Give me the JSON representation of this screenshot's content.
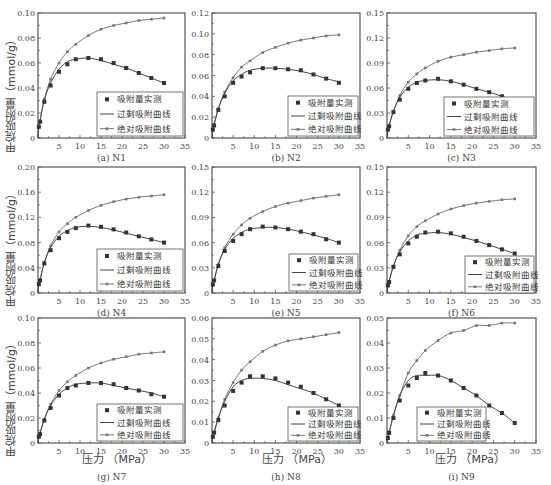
{
  "figure": {
    "ylabel": "甲烷吸附量（mmol/g）",
    "xlabel": "压力 （MPa）",
    "legend": [
      "吸附量实测",
      "过剩吸附曲线",
      "绝对吸附曲线"
    ],
    "colors": {
      "axis": "#555555",
      "excess": "#444444",
      "absolute": "#777777",
      "marker": "#333333"
    }
  },
  "chart_data": [
    {
      "id": "N1",
      "caption": "(a) N1",
      "type": "line",
      "xlim": [
        0,
        35
      ],
      "ylim": [
        0,
        0.1
      ],
      "yticks": [
        0,
        0.02,
        0.04,
        0.06,
        0.08,
        0.1
      ],
      "ytick_labels": [
        "0",
        "0.02",
        "0.04",
        "0.06",
        "0.08",
        "0.10"
      ],
      "xticks": [
        0,
        5,
        10,
        15,
        20,
        25,
        30,
        35
      ],
      "x": [
        0.2,
        0.5,
        1.5,
        3,
        5,
        7,
        9,
        12,
        15,
        18,
        21,
        24,
        27,
        30
      ],
      "series": [
        {
          "name": "吸附量实测",
          "values": [
            0.009,
            0.013,
            0.029,
            0.042,
            0.053,
            0.059,
            0.063,
            0.064,
            0.063,
            0.06,
            0.056,
            0.052,
            0.048,
            0.044
          ]
        },
        {
          "name": "过剩吸附曲线",
          "values": [
            0.009,
            0.014,
            0.03,
            0.044,
            0.055,
            0.061,
            0.063,
            0.064,
            0.062,
            0.059,
            0.056,
            0.052,
            0.048,
            0.044
          ]
        },
        {
          "name": "绝对吸附曲线",
          "values": [
            0.009,
            0.014,
            0.031,
            0.047,
            0.06,
            0.069,
            0.075,
            0.082,
            0.087,
            0.09,
            0.092,
            0.094,
            0.095,
            0.096
          ]
        }
      ],
      "legend_position": "lower right"
    },
    {
      "id": "N2",
      "caption": "(b) N2",
      "type": "line",
      "xlim": [
        0,
        35
      ],
      "ylim": [
        0,
        0.12
      ],
      "yticks": [
        0,
        0.02,
        0.04,
        0.06,
        0.08,
        0.1,
        0.12
      ],
      "ytick_labels": [
        "0",
        "0.02",
        "0.04",
        "0.06",
        "0.08",
        "0.10",
        "0.12"
      ],
      "xticks": [
        0,
        5,
        10,
        15,
        20,
        25,
        30,
        35
      ],
      "x": [
        0.2,
        0.5,
        1.5,
        3,
        5,
        7,
        9,
        12,
        15,
        18,
        21,
        24,
        27,
        30
      ],
      "series": [
        {
          "name": "吸附量实测",
          "values": [
            0.008,
            0.012,
            0.027,
            0.04,
            0.053,
            0.059,
            0.063,
            0.067,
            0.067,
            0.066,
            0.065,
            0.061,
            0.057,
            0.053
          ]
        },
        {
          "name": "过剩吸附曲线",
          "values": [
            0.008,
            0.013,
            0.028,
            0.043,
            0.055,
            0.061,
            0.065,
            0.067,
            0.067,
            0.066,
            0.064,
            0.061,
            0.057,
            0.054
          ]
        },
        {
          "name": "绝对吸附曲线",
          "values": [
            0.008,
            0.013,
            0.028,
            0.044,
            0.058,
            0.068,
            0.074,
            0.082,
            0.087,
            0.091,
            0.094,
            0.096,
            0.098,
            0.099
          ]
        }
      ],
      "legend_position": "lower right"
    },
    {
      "id": "N3",
      "caption": "(c) N3",
      "type": "line",
      "xlim": [
        0,
        35
      ],
      "ylim": [
        0,
        0.15
      ],
      "yticks": [
        0,
        0.03,
        0.06,
        0.09,
        0.12,
        0.15
      ],
      "ytick_labels": [
        "0",
        "0.03",
        "0.06",
        "0.09",
        "0.12",
        "0.15"
      ],
      "xticks": [
        0,
        5,
        10,
        15,
        20,
        25,
        30,
        35
      ],
      "x": [
        0.2,
        0.5,
        1.5,
        3,
        5,
        7,
        9,
        12,
        15,
        18,
        21,
        24,
        27,
        30
      ],
      "series": [
        {
          "name": "吸附量实测",
          "values": [
            0.01,
            0.014,
            0.031,
            0.046,
            0.059,
            0.066,
            0.069,
            0.071,
            0.068,
            0.064,
            0.059,
            0.055,
            0.05,
            0.045
          ]
        },
        {
          "name": "过剩吸附曲线",
          "values": [
            0.01,
            0.015,
            0.032,
            0.049,
            0.061,
            0.067,
            0.069,
            0.07,
            0.068,
            0.064,
            0.059,
            0.055,
            0.05,
            0.045
          ]
        },
        {
          "name": "绝对吸附曲线",
          "values": [
            0.01,
            0.015,
            0.032,
            0.051,
            0.067,
            0.077,
            0.084,
            0.092,
            0.097,
            0.1,
            0.103,
            0.105,
            0.107,
            0.108
          ]
        }
      ],
      "legend_position": "lower right"
    },
    {
      "id": "N4",
      "caption": "(d) N4",
      "type": "line",
      "xlim": [
        0,
        35
      ],
      "ylim": [
        0,
        0.2
      ],
      "yticks": [
        0,
        0.04,
        0.08,
        0.12,
        0.16,
        0.2
      ],
      "ytick_labels": [
        "0",
        "0.04",
        "0.08",
        "0.12",
        "0.16",
        "0.20"
      ],
      "xticks": [
        0,
        5,
        10,
        15,
        20,
        25,
        30,
        35
      ],
      "x": [
        0.2,
        0.5,
        1.5,
        3,
        5,
        7,
        9,
        12,
        15,
        18,
        21,
        24,
        27,
        30
      ],
      "series": [
        {
          "name": "吸附量实测",
          "values": [
            0.014,
            0.02,
            0.047,
            0.068,
            0.087,
            0.097,
            0.103,
            0.107,
            0.105,
            0.101,
            0.096,
            0.09,
            0.085,
            0.08
          ]
        },
        {
          "name": "过剩吸附曲线",
          "values": [
            0.014,
            0.021,
            0.048,
            0.072,
            0.09,
            0.099,
            0.104,
            0.106,
            0.104,
            0.1,
            0.095,
            0.09,
            0.085,
            0.08
          ]
        },
        {
          "name": "绝对吸附曲线",
          "values": [
            0.014,
            0.021,
            0.048,
            0.075,
            0.097,
            0.11,
            0.12,
            0.131,
            0.139,
            0.145,
            0.149,
            0.152,
            0.154,
            0.156
          ]
        }
      ],
      "legend_position": "lower right"
    },
    {
      "id": "N5",
      "caption": "(e) N5",
      "type": "line",
      "xlim": [
        0,
        35
      ],
      "ylim": [
        0,
        0.15
      ],
      "yticks": [
        0,
        0.03,
        0.06,
        0.09,
        0.12,
        0.15
      ],
      "ytick_labels": [
        "0",
        "0.03",
        "0.06",
        "0.09",
        "0.12",
        "0.15"
      ],
      "xticks": [
        0,
        5,
        10,
        15,
        20,
        25,
        30,
        35
      ],
      "x": [
        0.2,
        0.5,
        1.5,
        3,
        5,
        7,
        9,
        12,
        15,
        18,
        21,
        24,
        27,
        30
      ],
      "series": [
        {
          "name": "吸附量实测",
          "values": [
            0.01,
            0.015,
            0.032,
            0.05,
            0.062,
            0.07,
            0.076,
            0.079,
            0.078,
            0.076,
            0.073,
            0.07,
            0.064,
            0.06
          ]
        },
        {
          "name": "过剩吸附曲线",
          "values": [
            0.01,
            0.015,
            0.034,
            0.052,
            0.065,
            0.072,
            0.076,
            0.078,
            0.078,
            0.076,
            0.073,
            0.069,
            0.065,
            0.06
          ]
        },
        {
          "name": "绝对吸附曲线",
          "values": [
            0.01,
            0.015,
            0.034,
            0.054,
            0.07,
            0.081,
            0.089,
            0.097,
            0.103,
            0.107,
            0.11,
            0.113,
            0.115,
            0.117
          ]
        }
      ],
      "legend_position": "lower right"
    },
    {
      "id": "N6",
      "caption": "(f) N6",
      "type": "line",
      "xlim": [
        0,
        35
      ],
      "ylim": [
        0,
        0.15
      ],
      "yticks": [
        0,
        0.03,
        0.06,
        0.09,
        0.12,
        0.15
      ],
      "ytick_labels": [
        "0",
        "0.03",
        "0.06",
        "0.09",
        "0.12",
        "0.15"
      ],
      "xticks": [
        0,
        5,
        10,
        15,
        20,
        25,
        30,
        35
      ],
      "x": [
        0.2,
        0.5,
        1.5,
        3,
        5,
        7,
        9,
        12,
        15,
        18,
        21,
        24,
        27,
        30
      ],
      "series": [
        {
          "name": "吸附量实测",
          "values": [
            0.009,
            0.013,
            0.031,
            0.046,
            0.059,
            0.067,
            0.072,
            0.073,
            0.071,
            0.067,
            0.062,
            0.057,
            0.052,
            0.047
          ]
        },
        {
          "name": "过剩吸附曲线",
          "values": [
            0.009,
            0.014,
            0.032,
            0.049,
            0.062,
            0.069,
            0.071,
            0.072,
            0.07,
            0.066,
            0.062,
            0.057,
            0.052,
            0.047
          ]
        },
        {
          "name": "绝对吸附曲线",
          "values": [
            0.009,
            0.014,
            0.032,
            0.051,
            0.068,
            0.079,
            0.086,
            0.094,
            0.1,
            0.104,
            0.107,
            0.109,
            0.111,
            0.112
          ]
        }
      ],
      "legend_position": "lower right"
    },
    {
      "id": "N7",
      "caption": "(g) N7",
      "type": "line",
      "xlim": [
        0,
        35
      ],
      "ylim": [
        0,
        0.1
      ],
      "yticks": [
        0,
        0.02,
        0.04,
        0.06,
        0.08,
        0.1
      ],
      "ytick_labels": [
        "0",
        "0.02",
        "0.04",
        "0.06",
        "0.08",
        "0.10"
      ],
      "xticks": [
        0,
        5,
        10,
        15,
        20,
        25,
        30,
        35
      ],
      "x": [
        0.2,
        0.5,
        1.5,
        3,
        5,
        7,
        9,
        12,
        15,
        18,
        21,
        24,
        27,
        30
      ],
      "series": [
        {
          "name": "吸附量实测",
          "values": [
            0.005,
            0.007,
            0.018,
            0.028,
            0.038,
            0.044,
            0.046,
            0.048,
            0.048,
            0.047,
            0.044,
            0.042,
            0.039,
            0.037
          ]
        },
        {
          "name": "过剩吸附曲线",
          "values": [
            0.005,
            0.008,
            0.019,
            0.03,
            0.039,
            0.044,
            0.047,
            0.048,
            0.048,
            0.046,
            0.044,
            0.042,
            0.04,
            0.037
          ]
        },
        {
          "name": "绝对吸附曲线",
          "values": [
            0.005,
            0.008,
            0.019,
            0.031,
            0.042,
            0.049,
            0.054,
            0.06,
            0.064,
            0.067,
            0.069,
            0.071,
            0.072,
            0.073
          ]
        }
      ],
      "legend_position": "lower right"
    },
    {
      "id": "N8",
      "caption": "(h) N8",
      "type": "line",
      "xlim": [
        0,
        35
      ],
      "ylim": [
        0,
        0.06
      ],
      "yticks": [
        0,
        0.01,
        0.02,
        0.03,
        0.04,
        0.05,
        0.06
      ],
      "ytick_labels": [
        "0",
        "0.01",
        "0.02",
        "0.03",
        "0.04",
        "0.05",
        "0.06"
      ],
      "xticks": [
        0,
        5,
        10,
        15,
        20,
        25,
        30,
        35
      ],
      "x": [
        0.2,
        0.5,
        1.5,
        3,
        5,
        7,
        9,
        12,
        15,
        18,
        21,
        24,
        27,
        30
      ],
      "series": [
        {
          "name": "吸附量实测",
          "values": [
            0.003,
            0.005,
            0.011,
            0.018,
            0.025,
            0.029,
            0.032,
            0.032,
            0.031,
            0.029,
            0.027,
            0.024,
            0.021,
            0.018
          ]
        },
        {
          "name": "过剩吸附曲线",
          "values": [
            0.003,
            0.005,
            0.012,
            0.02,
            0.027,
            0.03,
            0.031,
            0.031,
            0.03,
            0.028,
            0.026,
            0.024,
            0.021,
            0.018
          ]
        },
        {
          "name": "绝对吸附曲线",
          "values": [
            0.003,
            0.005,
            0.012,
            0.021,
            0.029,
            0.035,
            0.039,
            0.044,
            0.047,
            0.049,
            0.05,
            0.051,
            0.052,
            0.053
          ]
        }
      ],
      "legend_position": "lower right"
    },
    {
      "id": "N9",
      "caption": "(i) N9",
      "type": "line",
      "xlim": [
        0,
        35
      ],
      "ylim": [
        0,
        0.05
      ],
      "yticks": [
        0,
        0.01,
        0.02,
        0.03,
        0.04,
        0.05
      ],
      "ytick_labels": [
        "0",
        "0.01",
        "0.02",
        "0.03",
        "0.04",
        "0.05"
      ],
      "xticks": [
        0,
        5,
        10,
        15,
        20,
        25,
        30,
        35
      ],
      "x": [
        0.2,
        0.5,
        1.5,
        3,
        5,
        7,
        9,
        12,
        15,
        18,
        21,
        24,
        27,
        30
      ],
      "series": [
        {
          "name": "吸附量实测",
          "values": [
            0.002,
            0.004,
            0.01,
            0.017,
            0.023,
            0.026,
            0.028,
            0.027,
            0.025,
            0.022,
            0.019,
            0.015,
            0.012,
            0.008
          ]
        },
        {
          "name": "过剩吸附曲线",
          "values": [
            0.002,
            0.004,
            0.011,
            0.019,
            0.025,
            0.027,
            0.027,
            0.027,
            0.025,
            0.022,
            0.019,
            0.015,
            0.012,
            0.008
          ]
        },
        {
          "name": "绝对吸附曲线",
          "values": [
            0.002,
            0.004,
            0.011,
            0.019,
            0.028,
            0.033,
            0.037,
            0.041,
            0.044,
            0.045,
            0.047,
            0.047,
            0.048,
            0.048
          ]
        }
      ],
      "legend_position": "lower left-center"
    }
  ],
  "layout": {
    "panels": [
      {
        "left": 38,
        "top": 13,
        "right": 185,
        "bottom": 138,
        "legend": {
          "x": 97,
          "y": 92,
          "w": 86,
          "h": 44
        }
      },
      {
        "left": 212,
        "top": 13,
        "right": 360,
        "bottom": 138,
        "legend": {
          "x": 288,
          "y": 96,
          "w": 70,
          "h": 40
        }
      },
      {
        "left": 387,
        "top": 13,
        "right": 536,
        "bottom": 138,
        "legend": {
          "x": 444,
          "y": 97,
          "w": 90,
          "h": 39
        }
      },
      {
        "left": 38,
        "top": 167,
        "right": 185,
        "bottom": 293,
        "legend": {
          "x": 97,
          "y": 249,
          "w": 86,
          "h": 42
        }
      },
      {
        "left": 212,
        "top": 167,
        "right": 360,
        "bottom": 293,
        "legend": {
          "x": 289,
          "y": 254,
          "w": 69,
          "h": 37
        }
      },
      {
        "left": 387,
        "top": 167,
        "right": 536,
        "bottom": 293,
        "legend": {
          "x": 465,
          "y": 256,
          "w": 69,
          "h": 37
        }
      },
      {
        "left": 38,
        "top": 318,
        "right": 185,
        "bottom": 443,
        "legend": {
          "x": 97,
          "y": 404,
          "w": 86,
          "h": 37
        }
      },
      {
        "left": 212,
        "top": 318,
        "right": 360,
        "bottom": 443,
        "legend": {
          "x": 288,
          "y": 407,
          "w": 70,
          "h": 34
        }
      },
      {
        "left": 387,
        "top": 318,
        "right": 536,
        "bottom": 443,
        "legend": {
          "x": 417,
          "y": 407,
          "w": 69,
          "h": 34
        }
      }
    ],
    "ylabels": [
      {
        "x": 6,
        "y": 34,
        "h": 100
      },
      {
        "x": 6,
        "y": 186,
        "h": 100
      },
      {
        "x": 6,
        "y": 336,
        "h": 100
      }
    ],
    "xlabels": [
      {
        "x": 82,
        "y": 449
      },
      {
        "x": 268,
        "y": 455
      },
      {
        "x": 432,
        "y": 455
      }
    ]
  }
}
